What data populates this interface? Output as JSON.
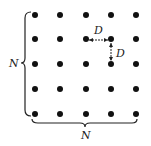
{
  "diagram": {
    "grid": {
      "rows": 5,
      "cols": 5,
      "xs": [
        35,
        60,
        86,
        111,
        136
      ],
      "ys": [
        15,
        39,
        64,
        89,
        114
      ],
      "dot_color": "#111111"
    },
    "labels": {
      "left_brace": "N",
      "bottom_brace": "N",
      "horizontal_spacing": "D",
      "vertical_spacing": "D"
    }
  }
}
